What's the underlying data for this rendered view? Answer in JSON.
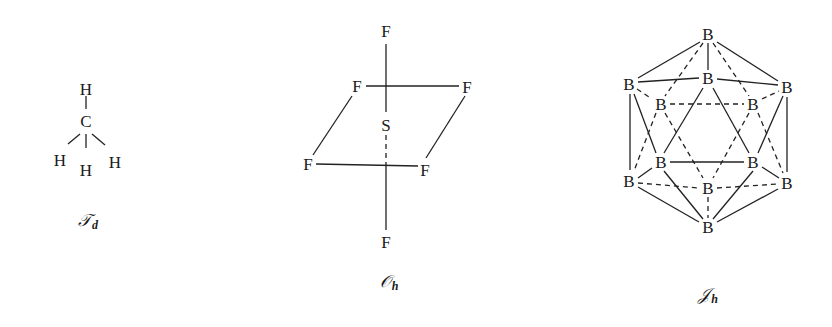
{
  "molecules": [
    {
      "name": "methane",
      "point_group_symbol": "𝒯",
      "point_group_sub": "d",
      "center_atom": "C",
      "ligand_atom": "H"
    },
    {
      "name": "sulfur-hexafluoride",
      "point_group_symbol": "𝒪",
      "point_group_sub": "h",
      "center_atom": "S",
      "ligand_atom": "F"
    },
    {
      "name": "icosahedral-borane",
      "point_group_symbol": "𝒥",
      "point_group_sub": "h",
      "vertex_atom": "B"
    }
  ],
  "colors": {
    "ink": "#222222",
    "background": "#ffffff"
  }
}
